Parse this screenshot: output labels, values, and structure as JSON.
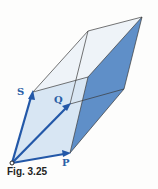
{
  "figure": {
    "caption": "Fig. 3.25",
    "labels": {
      "s": "S",
      "q": "Q",
      "p": "P"
    },
    "colors": {
      "vector": "#2358a8",
      "face_light": "#dbe8f4",
      "face_dark": "#5f8fc8",
      "edge": "#3a3a3a"
    }
  }
}
